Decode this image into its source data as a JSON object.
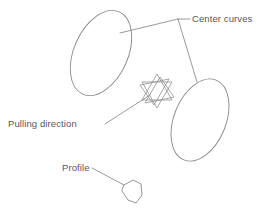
{
  "figure": {
    "background_color": "#ffffff",
    "line_color": "#8a8a8a",
    "text_color": "#575757"
  },
  "labels": {
    "center_curves": "Center curves",
    "pulling_direction": "Pulling direction",
    "profile": "Profile"
  },
  "shapes": {
    "left_curve_name": "left-center-curve-ellipse",
    "right_curve_name": "right-center-curve-ellipse",
    "direction_marker_name": "pulling-direction-hexagram",
    "profile_name": "profile-polygon"
  },
  "geometry": {
    "left_ellipse": {
      "cx": 101,
      "cy": 53,
      "rx": 27,
      "ry": 45,
      "rotation": 24
    },
    "right_ellipse": {
      "cx": 200,
      "cy": 120,
      "rx": 26,
      "ry": 43,
      "rotation": 22
    },
    "hexagram": {
      "cx": 157,
      "cy": 91,
      "r": 17
    },
    "profile_polygon": "124,185 133,180 141,184 142,195 136,203 128,200 122,191",
    "leader_center_curves": {
      "junction": [
        178,
        19
      ],
      "to_left_curve": [
        120,
        33
      ],
      "to_right_curve": [
        197,
        82
      ],
      "to_text": [
        190,
        19
      ]
    },
    "leader_pulling_direction": {
      "from": [
        105,
        124
      ],
      "to": [
        150,
        95
      ]
    },
    "leader_profile": {
      "from": [
        92,
        168
      ],
      "to": [
        124,
        185
      ]
    }
  },
  "text_positions": {
    "center_curves": [
      192,
      22
    ],
    "pulling_direction": [
      8,
      127
    ],
    "profile": [
      62,
      171
    ]
  }
}
